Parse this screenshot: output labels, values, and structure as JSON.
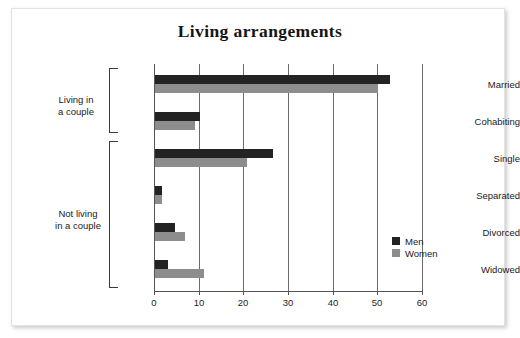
{
  "chart_data": {
    "type": "bar",
    "orientation": "horizontal",
    "title": "Living arrangements",
    "xlabel": "",
    "ylabel": "",
    "xlim": [
      0,
      60
    ],
    "xticks": [
      0,
      10,
      20,
      30,
      40,
      50,
      60
    ],
    "xtick_labels": [
      "0",
      "10",
      "20",
      "30",
      "40",
      "50",
      "60"
    ],
    "grid": "vertical",
    "legend_position": "bottom-right",
    "categories": [
      "Married",
      "Cohabiting",
      "Single",
      "Separated",
      "Divorced",
      "Widowed"
    ],
    "series": [
      {
        "name": "Men",
        "color": "#232323",
        "values": [
          52.5,
          10.0,
          26.5,
          1.5,
          4.5,
          3.0
        ]
      },
      {
        "name": "Women",
        "color": "#8d8d8d",
        "values": [
          50.0,
          9.0,
          20.5,
          1.5,
          6.8,
          11.0
        ]
      }
    ],
    "groups": [
      {
        "label": "Living in\na couple",
        "categories": [
          "Married",
          "Cohabiting"
        ]
      },
      {
        "label": "Not living\nin a couple",
        "categories": [
          "Single",
          "Separated",
          "Divorced",
          "Widowed"
        ]
      }
    ]
  },
  "legend": {
    "items": [
      {
        "label": "Men"
      },
      {
        "label": "Women"
      }
    ]
  }
}
